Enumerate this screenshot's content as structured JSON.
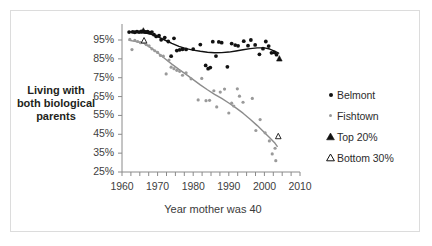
{
  "chart_data": {
    "type": "scatter",
    "title": "",
    "xlabel": "Year mother was 40",
    "ylabel": "Living with both biological parents",
    "xlim": [
      1960,
      2010
    ],
    "ylim": [
      25,
      100
    ],
    "xticks": [
      1960,
      1970,
      1980,
      1990,
      2000,
      2010
    ],
    "yticks": [
      25,
      35,
      45,
      55,
      65,
      75,
      85,
      95
    ],
    "ytick_labels": [
      "25%",
      "35%",
      "45%",
      "55%",
      "65%",
      "75%",
      "85%",
      "95%"
    ],
    "xtick_labels": [
      "1960",
      "1970",
      "1980",
      "1990",
      "2000",
      "2010"
    ],
    "grid": false,
    "legend_position": "right",
    "legend": [
      {
        "label": "Belmont",
        "marker": "filled-circle",
        "color": "#111111"
      },
      {
        "label": "Fishtown",
        "marker": "filled-circle",
        "color": "#9a9a9a"
      },
      {
        "label": "Top 20%",
        "marker": "filled-triangle",
        "color": "#111111"
      },
      {
        "label": "Bottom 30%",
        "marker": "open-triangle",
        "color": "#111111"
      }
    ],
    "series": [
      {
        "name": "Belmont",
        "marker": "filled-circle",
        "color": "#111111",
        "points": [
          [
            1962,
            99.2
          ],
          [
            1963,
            99.3
          ],
          [
            1963.6,
            99.1
          ],
          [
            1964.2,
            99.4
          ],
          [
            1964.8,
            99.2
          ],
          [
            1965.4,
            99.5
          ],
          [
            1966,
            99.6
          ],
          [
            1966.6,
            99.3
          ],
          [
            1967.2,
            99.4
          ],
          [
            1967.8,
            98.9
          ],
          [
            1968.4,
            99.2
          ],
          [
            1969,
            97.8
          ],
          [
            1969.6,
            96.9
          ],
          [
            1970.4,
            97.3
          ],
          [
            1971,
            95.1
          ],
          [
            1972,
            96.3
          ],
          [
            1973,
            94.2
          ],
          [
            1973.8,
            86.4
          ],
          [
            1974.6,
            95.9
          ],
          [
            1975.4,
            89.4
          ],
          [
            1976.2,
            89.8
          ],
          [
            1977,
            90.1
          ],
          [
            1978,
            90.0
          ],
          [
            1980,
            90.2
          ],
          [
            1982,
            92.6
          ],
          [
            1983.5,
            81.5
          ],
          [
            1984.2,
            79.8
          ],
          [
            1984.8,
            80.4
          ],
          [
            1985.5,
            94.1
          ],
          [
            1986.4,
            86.5
          ],
          [
            1987.2,
            94.0
          ],
          [
            1988,
            93.6
          ],
          [
            1989.6,
            80.8
          ],
          [
            1990.8,
            93.1
          ],
          [
            1991.8,
            92.3
          ],
          [
            1992.6,
            91.9
          ],
          [
            1994.2,
            94.4
          ],
          [
            1995.4,
            92.0
          ],
          [
            1996.2,
            95.0
          ],
          [
            1997.4,
            92.4
          ],
          [
            1998.6,
            87.4
          ],
          [
            1999.6,
            90.4
          ],
          [
            2000.4,
            94.2
          ],
          [
            2001.2,
            91.8
          ],
          [
            2002,
            88.2
          ],
          [
            2002.8,
            88.4
          ],
          [
            2003.4,
            87.2
          ]
        ]
      },
      {
        "name": "Fishtown",
        "marker": "filled-circle",
        "color": "#9a9a9a",
        "points": [
          [
            1962.2,
            95.3
          ],
          [
            1962.8,
            89.9
          ],
          [
            1963.6,
            94.8
          ],
          [
            1964.4,
            94.2
          ],
          [
            1965.2,
            93.6
          ],
          [
            1966,
            94.0
          ],
          [
            1966.8,
            92.6
          ],
          [
            1967.6,
            91.9
          ],
          [
            1968.4,
            90.3
          ],
          [
            1969.2,
            89.3
          ],
          [
            1970,
            88.4
          ],
          [
            1970.8,
            86.8
          ],
          [
            1971.6,
            86.4
          ],
          [
            1972.4,
            77.0
          ],
          [
            1973.2,
            84.4
          ],
          [
            1973.8,
            80.6
          ],
          [
            1974.6,
            79.8
          ],
          [
            1975.4,
            78.9
          ],
          [
            1976.2,
            78.4
          ],
          [
            1977,
            76.3
          ],
          [
            1978,
            77.6
          ],
          [
            1979.4,
            74.4
          ],
          [
            1981.4,
            63.2
          ],
          [
            1982.4,
            74.6
          ],
          [
            1983.6,
            62.8
          ],
          [
            1984.6,
            63.0
          ],
          [
            1985.8,
            68.1
          ],
          [
            1986.6,
            59.5
          ],
          [
            1987.6,
            67.4
          ],
          [
            1988.8,
            69.0
          ],
          [
            1990,
            56.3
          ],
          [
            1990.8,
            61.5
          ],
          [
            1991.4,
            60.0
          ],
          [
            1992.4,
            69.1
          ],
          [
            1993,
            65.2
          ],
          [
            1994,
            62.0
          ],
          [
            1996.6,
            64.0
          ],
          [
            1997.6,
            47.0
          ],
          [
            1998.8,
            52.8
          ],
          [
            2000.2,
            45.8
          ],
          [
            2001.4,
            41.5
          ],
          [
            2002.2,
            34.6
          ],
          [
            2003,
            37.6
          ],
          [
            2003.2,
            31.0
          ]
        ]
      }
    ],
    "trend_lines": [
      {
        "name": "Belmont trend",
        "color": "#111111",
        "points": [
          [
            1962,
            99.3
          ],
          [
            1964,
            99.2
          ],
          [
            1966,
            99.0
          ],
          [
            1968,
            98.2
          ],
          [
            1970,
            96.8
          ],
          [
            1972,
            95.0
          ],
          [
            1974,
            93.2
          ],
          [
            1976,
            91.6
          ],
          [
            1978,
            90.4
          ],
          [
            1980,
            89.6
          ],
          [
            1982,
            89.0
          ],
          [
            1984,
            88.5
          ],
          [
            1986,
            88.2
          ],
          [
            1988,
            88.3
          ],
          [
            1990,
            88.6
          ],
          [
            1992,
            89.2
          ],
          [
            1994,
            89.8
          ],
          [
            1996,
            90.4
          ],
          [
            1998,
            90.8
          ],
          [
            2000,
            90.8
          ],
          [
            2001.5,
            90.2
          ],
          [
            2003,
            89.0
          ],
          [
            2004,
            88.0
          ]
        ]
      },
      {
        "name": "Fishtown trend",
        "color": "#8c8c8c",
        "points": [
          [
            1962,
            94.8
          ],
          [
            1964,
            94.2
          ],
          [
            1966,
            93.4
          ],
          [
            1968,
            91.0
          ],
          [
            1970,
            88.2
          ],
          [
            1972,
            85.2
          ],
          [
            1974,
            82.2
          ],
          [
            1976,
            79.4
          ],
          [
            1978,
            76.8
          ],
          [
            1980,
            74.0
          ],
          [
            1982,
            71.2
          ],
          [
            1984,
            68.6
          ],
          [
            1986,
            66.2
          ],
          [
            1988,
            64.0
          ],
          [
            1990,
            61.6
          ],
          [
            1992,
            59.0
          ],
          [
            1994,
            56.2
          ],
          [
            1996,
            53.0
          ],
          [
            1998,
            49.6
          ],
          [
            2000,
            46.0
          ],
          [
            2001.5,
            43.2
          ],
          [
            2003,
            40.2
          ],
          [
            2003.6,
            38.6
          ]
        ]
      }
    ],
    "special_markers": [
      {
        "name": "Top 20%",
        "marker": "filled-triangle",
        "color": "#111111",
        "x": 2004.2,
        "y": 85.0
      },
      {
        "name": "Bottom 30%",
        "marker": "open-triangle",
        "color": "#111111",
        "x": 2003.9,
        "y": 43.8
      },
      {
        "name": "Top 20% early",
        "marker": "filled-triangle",
        "color": "#111111",
        "x": 1966.0,
        "y": 99.8
      },
      {
        "name": "Bottom 30% early",
        "marker": "open-triangle",
        "color": "#111111",
        "x": 1966.2,
        "y": 94.6
      }
    ]
  }
}
